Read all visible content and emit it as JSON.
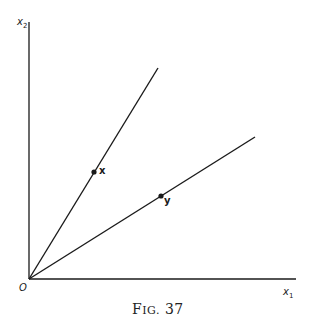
{
  "figure": {
    "caption": "Fig. 37",
    "caption_prefix": "F",
    "caption_smallcaps": "IG.",
    "caption_number": "37"
  },
  "axes": {
    "x_label": "x",
    "x_sub": "1",
    "y_label": "x",
    "y_sub": "2",
    "origin_label": "O"
  },
  "lines": [
    {
      "name": "ray-x",
      "from": [
        29,
        279
      ],
      "to": [
        158,
        68
      ]
    },
    {
      "name": "ray-y",
      "from": [
        29,
        279
      ],
      "to": [
        255,
        137
      ]
    }
  ],
  "points": [
    {
      "name": "x",
      "label": "x",
      "pos": [
        94,
        172
      ]
    },
    {
      "name": "y",
      "label": "y",
      "pos": [
        161,
        194
      ]
    }
  ],
  "colors": {
    "ink": "#1a1a1a",
    "background": "#ffffff"
  }
}
